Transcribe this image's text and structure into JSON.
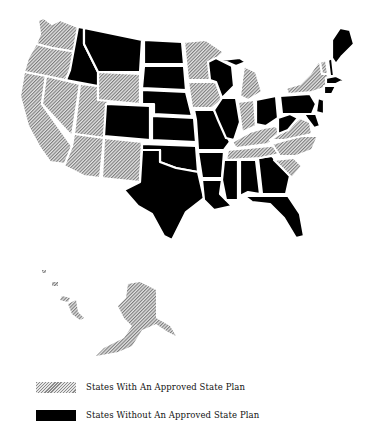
{
  "map": {
    "title": "",
    "region": "United States",
    "colors": {
      "approved": "#9a9a9a",
      "not_approved": "#000000",
      "background": "#ffffff",
      "border": "#ffffff"
    },
    "categories": {
      "approved": [
        "WA",
        "OR",
        "CA",
        "NV",
        "UT",
        "AZ",
        "NM",
        "WY",
        "MN",
        "IA",
        "MI",
        "IN",
        "KY",
        "TN",
        "NC",
        "SC",
        "VA",
        "NY",
        "VT",
        "AK"
      ],
      "not_approved": [
        "ID",
        "MT",
        "ND",
        "SD",
        "NE",
        "CO",
        "KS",
        "OK",
        "TX",
        "MO",
        "AR",
        "LA",
        "MS",
        "AL",
        "GA",
        "FL",
        "WI",
        "IL",
        "OH",
        "WV",
        "PA",
        "ME",
        "NH",
        "MA",
        "CT",
        "RI",
        "NJ",
        "DE",
        "MD"
      ]
    }
  },
  "legend": {
    "items": [
      {
        "label": "States With An Approved State Plan",
        "style": "hatched"
      },
      {
        "label": "States Without An Approved State Plan",
        "style": "solid"
      }
    ]
  }
}
